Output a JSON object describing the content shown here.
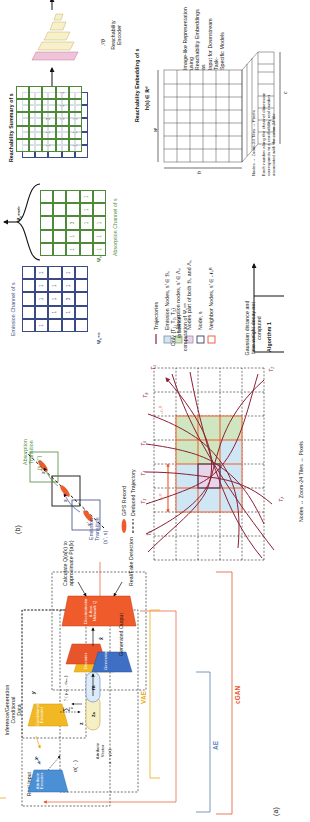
{
  "figure": {
    "panels": [
      {
        "tag": "(a)",
        "name": "conditional-generative-model"
      },
      {
        "tag": "(b)",
        "name": "reachability-embedding-pipeline"
      }
    ]
  },
  "panel_a": {
    "tag": "(a)",
    "real_input_data": "Real Input\nData",
    "real_input_symbol": "x",
    "attribute_encoder": "Attribute\nEncoder",
    "inference_header": "Inference/Generation\nConditional\nData",
    "conditional_symbol": "y",
    "conditional_encoder": "Conditional\nEncoder",
    "sigma_fn": "σ( · )",
    "attribute_vector": "Attribute\nVector",
    "attribute_vector_eq": "a ~ γ(x)",
    "z_label": "z",
    "zq_label": "zₐ",
    "m_label": "m",
    "sum_label": "∑",
    "sum_sub": "n",
    "sum_expr": "ℐ ( μₙₐ , σₙₐ )",
    "decoder": "Decoder",
    "generator": "Generator",
    "x_hat": "x̂",
    "generated_output": "Generated Output",
    "discriminator": "Discriminator\n& Aux. Network Q",
    "real_fake_detection": "Real/Fake Detection",
    "calculate_q": "Calculate Q(a|̂x) to\napproximate P(a|̂x)",
    "brace_ae": "AE",
    "brace_vae": "VAE",
    "brace_cgan": "cGAN",
    "colors": {
      "ae": "#5b7fb5",
      "vae": "#e8ab18",
      "cgan": "#e8552a"
    }
  },
  "panel_b": {
    "tag": "(b)",
    "emission_transition": "Emission\nTransition",
    "emission_pair": "(s', s)",
    "absorption_transition": "Absorption\nTransition",
    "absorption_pair": "(s, s'')",
    "node_s_prev": "s'",
    "node_s": "s",
    "node_s_next": "s''",
    "gps_record": "GPS Record",
    "deduced_trajectory": "Deduced Trajectory",
    "nodes_equiv": "Nodes ↔ Zoom-24 Tiles ↔ Pixels",
    "delta_r": "δₛᴿ",
    "neighborhood": "𝒩ₛᴿ",
    "trajectories": [
      "T₁",
      "T₂",
      "T₃",
      "T₄",
      "T₅",
      "T₆",
      "T₇",
      "T₈"
    ],
    "legend_title": "",
    "legend": [
      {
        "name": "trajectories",
        "kind": "line",
        "color": "#8b2034",
        "label": "Trajectories"
      },
      {
        "name": "emission-nodes",
        "kind": "swatch",
        "fill": "#cfe7f5",
        "stroke": "#6f7f9b",
        "label": "Emission Nodes, s' ∈ ℬₛ"
      },
      {
        "name": "absorption-nodes",
        "kind": "swatch",
        "fill": "#cfe6c0",
        "stroke": "#6f9b5b",
        "label": "Absorption nodes, s' ∈ Λₛ"
      },
      {
        "name": "both-nodes",
        "kind": "swatch",
        "fill": "#e8d5ea",
        "stroke": "#9b7f9b",
        "label": "Nodes part of both ℬₛ and Λₛ"
      },
      {
        "name": "node-s",
        "kind": "swatch",
        "fill": "#ffffff",
        "stroke": "#3a3a6b",
        "label": "Node, s"
      },
      {
        "name": "neighbor-nodes",
        "kind": "swatch",
        "fill": "#ffffff",
        "stroke": "#e8552a",
        "label": "Neighbor Nodes, s' ∈ 𝒩ₛᴿ"
      }
    ],
    "algorithm_label": "Algorithm 1",
    "gaussian_note": "Gaussian distance and\ntime weight decay not\ncomputed",
    "only_note": "Only {T₁, T₂, T₃} influence\ncomputation of Ψₛᵉᵐ",
    "emission_channel_title": "Emission Channel of s",
    "emission_channel_symbol": "Ψₛᵉᵐ",
    "absorption_channel_title": "Absorption Channel of s",
    "absorption_channel_symbol": "Ψₛᵃᵇ",
    "psi_combined": "Ψₛᵉᵐᵃᵇ",
    "reachability_summary_title": "Reachability Summary of s",
    "reachability_encoder": "Reachability\nEncoder",
    "encoder_symbol": "ℱθ",
    "reachability_embedding_title": "Reachability Embedding of s",
    "reachability_embedding_symbol": "h(s) ∈ ℝᵈ",
    "tensor_h": "h",
    "tensor_w": "w",
    "tensor_c": "c",
    "tensor_note_left": "Nodes ↔ Zoom-24 Tiles ↔ Pixels",
    "tensor_note_right": "Each number along the channel dimension\ncorresponds to a reachability real number\nassociated with the zoom-24 tile",
    "image_like_note": "Image-like Representation using\nReachability Embeddings as\nInput for Downstream Task-\nSpecific Models",
    "emission_grid": [
      [
        "",
        "",
        "",
        "",
        ""
      ],
      [
        "1",
        "",
        "1",
        "1",
        "1"
      ],
      [
        "",
        "1",
        "1",
        "1",
        ""
      ],
      [
        "",
        "1",
        "3",
        "1",
        "1"
      ],
      [
        "",
        "",
        "",
        "",
        ""
      ]
    ],
    "absorption_grid": [
      [
        "",
        "",
        "",
        "",
        ""
      ],
      [
        "",
        "",
        "",
        "",
        ""
      ],
      [
        "1",
        "1",
        "3",
        "",
        ""
      ],
      [
        "",
        "",
        "1",
        "1",
        "1"
      ],
      [
        "1",
        "1",
        "1",
        "",
        ""
      ]
    ],
    "summary_grid_blue": [
      [
        "",
        "",
        "",
        "",
        ""
      ],
      [
        "1",
        "",
        "1",
        "1",
        "1"
      ],
      [
        "",
        "1",
        "1",
        "1",
        ""
      ],
      [
        "",
        "1",
        "3",
        "1",
        "1"
      ],
      [
        "",
        "",
        "",
        "",
        ""
      ]
    ],
    "summary_grid_green": [
      [
        "",
        "",
        "",
        "",
        ""
      ],
      [
        "",
        "",
        "",
        "",
        ""
      ],
      [
        "1",
        "1",
        "3",
        "",
        ""
      ],
      [
        "",
        "",
        "1",
        "1",
        "1"
      ],
      [
        "1",
        "1",
        "1",
        "",
        ""
      ]
    ],
    "colors": {
      "emission": "#3a4a86",
      "absorption": "#4f8a3a",
      "neighbor": "#e8552a",
      "trajectory": "#8b2034",
      "both": "#9b7f9b"
    }
  }
}
